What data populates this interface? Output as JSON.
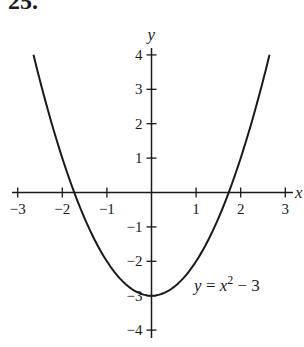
{
  "problem": {
    "number": "25."
  },
  "colors": {
    "ink": "#1a1a1a",
    "background": "#ffffff"
  },
  "chart_data": {
    "type": "line",
    "title": "",
    "xlabel": "x",
    "ylabel": "y",
    "function": "y = x^2 - 3",
    "annotation": {
      "text_prefix": "y = x",
      "exponent": "2",
      "text_suffix": " − 3",
      "x": 1.0,
      "y": -2.8
    },
    "xlim": [
      -3.1,
      3.2
    ],
    "ylim": [
      -4.2,
      4.3
    ],
    "xticks": [
      -3,
      -2,
      -1,
      1,
      2,
      3
    ],
    "xtick_labels": [
      "−3",
      "−2",
      "−1",
      "1",
      "2",
      "3"
    ],
    "yticks": [
      4,
      3,
      2,
      1,
      -1,
      -2,
      -3,
      -4
    ],
    "ytick_labels": [
      "4",
      "3",
      "2",
      "1",
      "−1",
      "−2",
      "−3",
      "−4"
    ],
    "x": [
      -2.646,
      -2.5,
      -2.0,
      -1.732,
      -1.5,
      -1.0,
      -0.5,
      0,
      0.5,
      1.0,
      1.5,
      1.732,
      2.0,
      2.5,
      2.646
    ],
    "y": [
      4.0,
      3.25,
      1.0,
      0.0,
      -0.75,
      -2.0,
      -2.75,
      -3.0,
      -2.75,
      -2.0,
      -0.75,
      0.0,
      1.0,
      3.25,
      4.0
    ],
    "x_intercepts": [
      -1.732,
      1.732
    ],
    "vertex": [
      0,
      -3
    ],
    "grid": false,
    "legend": null
  }
}
